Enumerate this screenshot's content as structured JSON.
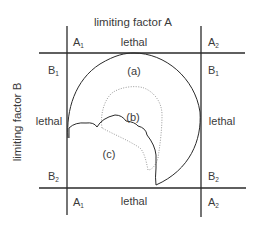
{
  "diagram": {
    "axis_top_title": "limiting factor A",
    "axis_left_title": "limiting factor B",
    "corners": {
      "top_left_A": {
        "base": "A",
        "sub": "1"
      },
      "top_right_A": {
        "base": "A",
        "sub": "2"
      },
      "bottom_left_A": {
        "base": "A",
        "sub": "1"
      },
      "bottom_right_A": {
        "base": "A",
        "sub": "2"
      },
      "top_left_B": {
        "base": "B",
        "sub": "1"
      },
      "top_right_B": {
        "base": "B",
        "sub": "1"
      },
      "bottom_left_B": {
        "base": "B",
        "sub": "2"
      },
      "bottom_right_B": {
        "base": "B",
        "sub": "2"
      }
    },
    "lethal_labels": {
      "top": "lethal",
      "bottom": "lethal",
      "left": "lethal",
      "right": "lethal"
    },
    "regions": {
      "a": "(a)",
      "b": "(b)",
      "c": "(c)"
    },
    "colors": {
      "line": "#2a2a2a",
      "text": "#3a3a3a",
      "dotted": "#9a9a9a"
    }
  }
}
